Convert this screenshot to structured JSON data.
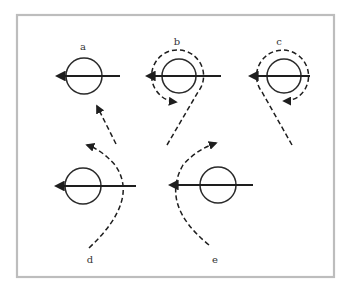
{
  "diagram": {
    "panels": [
      {
        "id": "a",
        "label": "a",
        "description": "body moving left; dashed particle path approaching from lower right, missing the body"
      },
      {
        "id": "b",
        "label": "b",
        "description": "body moving left; dashed path curves from below around the top of the body counterclockwise and ends with arrow at lower left"
      },
      {
        "id": "c",
        "label": "c",
        "description": "body moving left; dashed path from lower right curves around the top clockwise and ends with arrow below the body"
      },
      {
        "id": "d",
        "label": "d",
        "description": "body moving left; dashed path curves behind body from bottom, ending with arrow pointing up-left"
      },
      {
        "id": "e",
        "label": "e",
        "description": "body moving left; dashed path curves in front of body from bottom, ending with arrow pointing up-right"
      }
    ],
    "colors": {
      "frame": "#bdbdbd",
      "ink": "#1e1e1e",
      "background": "#ffffff"
    }
  }
}
